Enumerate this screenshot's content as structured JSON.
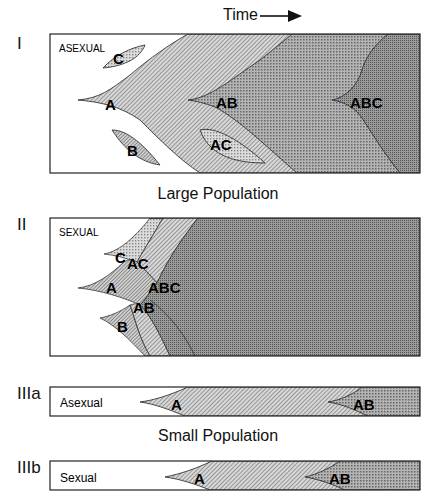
{
  "header": {
    "time_label": "Time"
  },
  "panels": {
    "I": {
      "numeral": "I",
      "mode_label": "ASEXUAL",
      "labels": [
        "C",
        "A",
        "B",
        "AB",
        "AC",
        "ABC"
      ]
    },
    "II": {
      "numeral": "II",
      "mode_label": "SEXUAL",
      "labels": [
        "C",
        "AC",
        "A",
        "ABC",
        "AB",
        "B"
      ]
    },
    "IIIa": {
      "numeral": "IIIa",
      "mode_label": "Asexual",
      "labels": [
        "A",
        "AB"
      ]
    },
    "IIIb": {
      "numeral": "IIIb",
      "mode_label": "Sexual",
      "labels": [
        "A",
        "AB"
      ]
    }
  },
  "captions": {
    "large": "Large Population",
    "small": "Small Population"
  },
  "colors": {
    "frame": "#222222",
    "light_fill": "#cfcfcf",
    "mid_fill": "#a8a8a8",
    "dark_fill": "#8a8a8a",
    "darkest_fill": "#7a7a7a"
  }
}
